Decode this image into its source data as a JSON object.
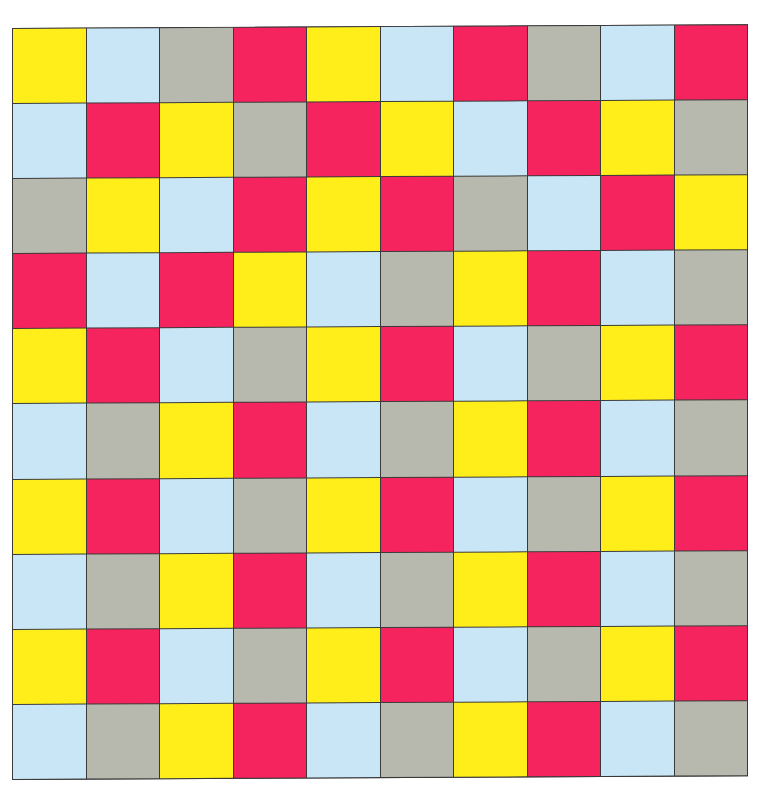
{
  "palette": {
    "Y": "#FFEE1A",
    "B": "#C8E6F5",
    "G": "#B7B8AE",
    "R": "#F5245E"
  },
  "palette_names": {
    "Y": "yellow",
    "B": "light-blue",
    "G": "gray",
    "R": "red"
  },
  "grid": {
    "rows": 10,
    "cols": 10,
    "border_color": "#3a3a3a",
    "cells": [
      [
        "Y",
        "B",
        "G",
        "R",
        "Y",
        "B",
        "R",
        "G",
        "B",
        "R"
      ],
      [
        "B",
        "R",
        "Y",
        "G",
        "R",
        "Y",
        "B",
        "R",
        "Y",
        "G"
      ],
      [
        "G",
        "Y",
        "B",
        "R",
        "Y",
        "R",
        "G",
        "B",
        "R",
        "Y"
      ],
      [
        "R",
        "B",
        "R",
        "Y",
        "B",
        "G",
        "Y",
        "R",
        "B",
        "G"
      ],
      [
        "Y",
        "R",
        "B",
        "G",
        "Y",
        "R",
        "B",
        "G",
        "Y",
        "R"
      ],
      [
        "B",
        "G",
        "Y",
        "R",
        "B",
        "G",
        "Y",
        "R",
        "B",
        "G"
      ],
      [
        "Y",
        "R",
        "B",
        "G",
        "Y",
        "R",
        "B",
        "G",
        "Y",
        "R"
      ],
      [
        "B",
        "G",
        "Y",
        "R",
        "B",
        "G",
        "Y",
        "R",
        "B",
        "G"
      ],
      [
        "Y",
        "R",
        "B",
        "G",
        "Y",
        "R",
        "B",
        "G",
        "Y",
        "R"
      ],
      [
        "B",
        "G",
        "Y",
        "R",
        "B",
        "G",
        "Y",
        "R",
        "B",
        "G"
      ]
    ]
  }
}
